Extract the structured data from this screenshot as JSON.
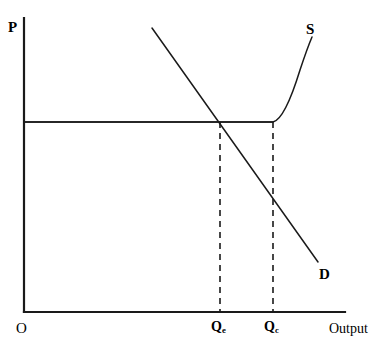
{
  "figure": {
    "kind": "supply-demand-diagram",
    "background_color": "#ffffff",
    "line_color": "#1a1a1a",
    "width": 386,
    "height": 353
  },
  "axes": {
    "y_axis_label": "P",
    "x_axis_label": "Output",
    "origin_label": "O",
    "x_axis": {
      "x_start": 24,
      "x_end": 345,
      "y": 312
    },
    "y_axis": {
      "y_start": 18,
      "y_end": 312,
      "x": 24
    }
  },
  "curves": {
    "supply": {
      "label": "S",
      "description": "horizontal at the fixed price then rising steeply after capacity Qc",
      "path": "M 24 122 L 273 122 C 282 120 292 96 300 70 C 305 55 309 44 312 37"
    },
    "demand": {
      "label": "D",
      "description": "downward sloping straight line",
      "path": "M 152 28 L 318 262"
    },
    "price_line": {
      "description": "horizontal price level line from the price axis to capacity",
      "path": "M 24 122 L 273 122"
    }
  },
  "markers": {
    "equilibrium_dashed": {
      "label": "Q",
      "subscript": "e",
      "x": 220,
      "y_top": 122,
      "y_bottom": 312
    },
    "capacity_dashed": {
      "label": "Q",
      "subscript": "c",
      "x": 273,
      "y_top": 122,
      "y_bottom": 312
    }
  },
  "chart_data": {
    "type": "line",
    "title": "",
    "xlabel": "Output",
    "ylabel": "P",
    "grid": false,
    "legend": "inline-curve-labels",
    "annotations": [
      "P",
      "O",
      "Output",
      "S",
      "D",
      "Qe",
      "Qc"
    ],
    "series": [
      {
        "name": "S",
        "description": "Supply: perfectly elastic (horizontal) up to capacity Qc, then vertical/steeply rising",
        "points": [
          {
            "x": 0,
            "y": 63
          },
          {
            "x": 78,
            "y": 63
          },
          {
            "x": 85,
            "y": 74
          },
          {
            "x": 86,
            "y": 86
          },
          {
            "x": 90,
            "y": 93
          }
        ]
      },
      {
        "name": "D",
        "description": "Demand: downward sloping straight line",
        "points": [
          {
            "x": 40,
            "y": 96
          },
          {
            "x": 92,
            "y": 17
          }
        ]
      },
      {
        "name": "Price line",
        "description": "Horizontal line at the ruling price from the P axis to capacity",
        "points": [
          {
            "x": 0,
            "y": 63
          },
          {
            "x": 78,
            "y": 63
          }
        ]
      }
    ],
    "xticks": [
      {
        "label": "O",
        "x": 0
      },
      {
        "label": "Qe",
        "x": 61
      },
      {
        "label": "Qc",
        "x": 78
      }
    ],
    "equilibrium": {
      "x_label": "Qe",
      "x": 61,
      "y": 63
    },
    "capacity": {
      "x_label": "Qc",
      "x": 78,
      "y": 63
    }
  }
}
